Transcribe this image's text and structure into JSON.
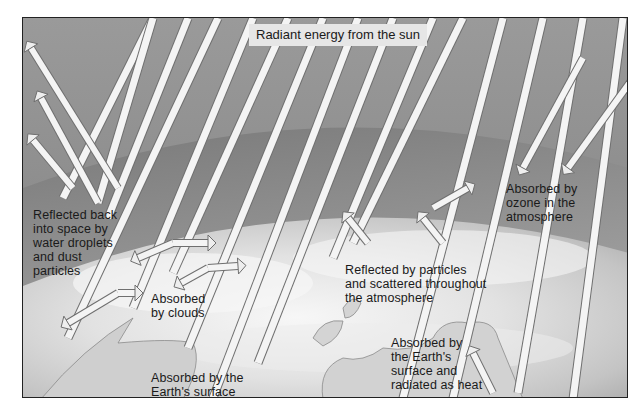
{
  "diagram": {
    "title": "Radiant energy from the sun",
    "labels": {
      "reflected_space": "Reflected back\ninto space by\nwater droplets\nand dust\nparticles",
      "absorbed_ozone": "Absorbed by\nozone in the\natmosphere",
      "reflected_particles": "Reflected by particles\nand scattered throughout\nthe atmosphere",
      "absorbed_clouds": "Absorbed\nby clouds",
      "absorbed_surface": "Absorbed by the\nEarth's surface",
      "absorbed_radiated": "Absorbed by\nthe Earth's\nsurface and\nradiated as heat"
    },
    "colors": {
      "space": "#8a8a8a",
      "atmosphere": "#9e9e9e",
      "earth_light": "#efefef",
      "beam": "#f4f4f4",
      "beam_edge": "#6f6f6f",
      "label_bg": "#e6e6e6"
    }
  }
}
